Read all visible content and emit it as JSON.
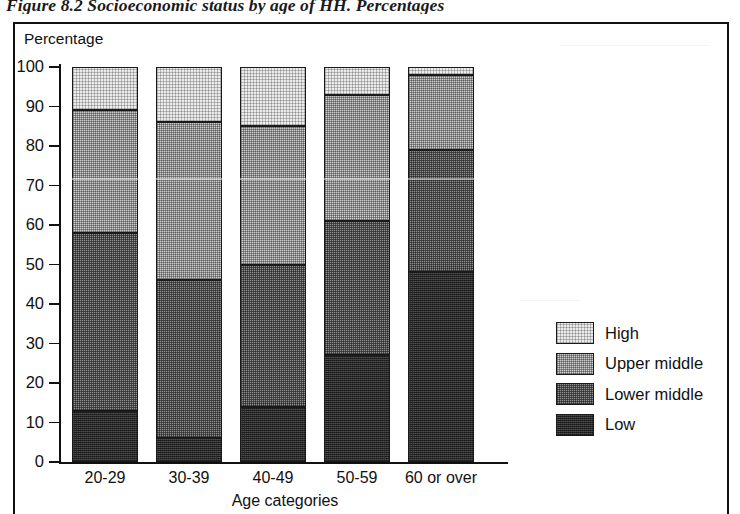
{
  "figure": {
    "caption": "Figure 8.2 Socioeconomic status by age of HH. Percentages"
  },
  "chart_data": {
    "type": "bar",
    "subtype": "stacked-bar-100",
    "title": "Figure 8.2 Socioeconomic status by age of HH. Percentages",
    "xlabel": "Age categories",
    "ylabel": "Percentage",
    "ylim": [
      0,
      100
    ],
    "ytick_labels": [
      "0",
      "10",
      "20",
      "30",
      "40",
      "50",
      "60",
      "70",
      "80",
      "90",
      "100"
    ],
    "yticks": [
      0,
      10,
      20,
      30,
      40,
      50,
      60,
      70,
      80,
      90,
      100
    ],
    "grid": false,
    "legend_position": "right",
    "categories": [
      "20-29",
      "30-39",
      "40-49",
      "50-59",
      "60 or over"
    ],
    "series": [
      {
        "name": "Low",
        "values": [
          13,
          6,
          14,
          27,
          48
        ]
      },
      {
        "name": "Lower middle",
        "values": [
          45,
          40,
          36,
          34,
          31
        ]
      },
      {
        "name": "Upper middle",
        "values": [
          31,
          40,
          35,
          32,
          19
        ]
      },
      {
        "name": "High",
        "values": [
          11,
          14,
          15,
          7,
          2
        ]
      }
    ],
    "cumulative_boundaries": {
      "low_top": [
        13,
        6,
        14,
        27,
        48
      ],
      "lower_middle_top": [
        58,
        46,
        50,
        61,
        79
      ],
      "upper_middle_top": [
        89,
        86,
        85,
        93,
        98
      ],
      "high_top": [
        100,
        100,
        100,
        100,
        100
      ]
    }
  },
  "legend": {
    "items": [
      {
        "label": "High",
        "swatch": "fill-high"
      },
      {
        "label": "Upper middle",
        "swatch": "fill-upper"
      },
      {
        "label": "Lower middle",
        "swatch": "fill-lower"
      },
      {
        "label": "Low",
        "swatch": "fill-low"
      }
    ]
  }
}
